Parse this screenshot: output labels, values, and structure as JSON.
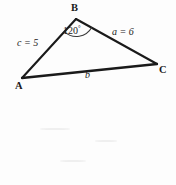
{
  "figure": {
    "type": "geometry-diagram",
    "shape": "triangle",
    "stroke_color": "#1a1a1a",
    "background_color": "#fdfdfd",
    "vertices": [
      {
        "id": "A",
        "label": "A",
        "x": 22,
        "y": 78
      },
      {
        "id": "B",
        "label": "B",
        "x": 76,
        "y": 19
      },
      {
        "id": "C",
        "label": "C",
        "x": 157,
        "y": 64
      }
    ],
    "sides": [
      {
        "id": "c",
        "label": "c = 5",
        "from": "A",
        "to": "B",
        "length": 5
      },
      {
        "id": "a",
        "label": "a = 6",
        "from": "B",
        "to": "C",
        "length": 6
      },
      {
        "id": "b",
        "label": "b",
        "from": "A",
        "to": "C",
        "length": null
      }
    ],
    "angles": [
      {
        "at": "B",
        "value": "120",
        "degree_symbol": "°",
        "label": "120°"
      }
    ]
  }
}
